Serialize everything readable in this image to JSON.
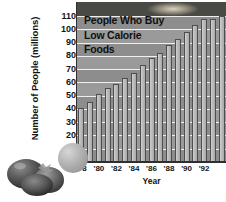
{
  "chart_data": {
    "type": "bar",
    "title_lines": [
      "People Who Buy",
      "Low Calorie",
      "Foods"
    ],
    "xlabel": "Year",
    "ylabel": "Number of People (millions)",
    "ylim": [
      0,
      110
    ],
    "ytick_labels": [
      "110",
      "100",
      "90",
      "80",
      "70",
      "60",
      "50",
      "40",
      "30",
      "20",
      "10"
    ],
    "ytick_values": [
      110,
      100,
      90,
      80,
      70,
      60,
      50,
      40,
      30,
      20,
      10
    ],
    "grid": true,
    "legend": "none",
    "categories": [
      "1978",
      "1979",
      "1980",
      "1981",
      "1982",
      "1983",
      "1984",
      "1985",
      "1986",
      "1987",
      "1988",
      "1989",
      "1990",
      "1991",
      "1992",
      "1993",
      "1994"
    ],
    "xtick_labels": [
      "'78",
      "'80",
      "'82",
      "'84",
      "'86",
      "'88",
      "'90",
      "'92"
    ],
    "xtick_index": [
      0,
      2,
      4,
      6,
      8,
      10,
      12,
      14
    ],
    "values": [
      41,
      45,
      51,
      56,
      59,
      63,
      67,
      73,
      78,
      82,
      88,
      93,
      98,
      103,
      108,
      108,
      110
    ],
    "bar_color": "#bdbdbd",
    "bar_edge_color": "#4e4e4e",
    "plot_background": "#9a9a9a",
    "gridline_color": "#efefef"
  },
  "decorations": {
    "top_photo_strip": "food-photo-strip",
    "bottom_left_image": "tomatoes-photo",
    "sphere": "gray-sphere"
  }
}
